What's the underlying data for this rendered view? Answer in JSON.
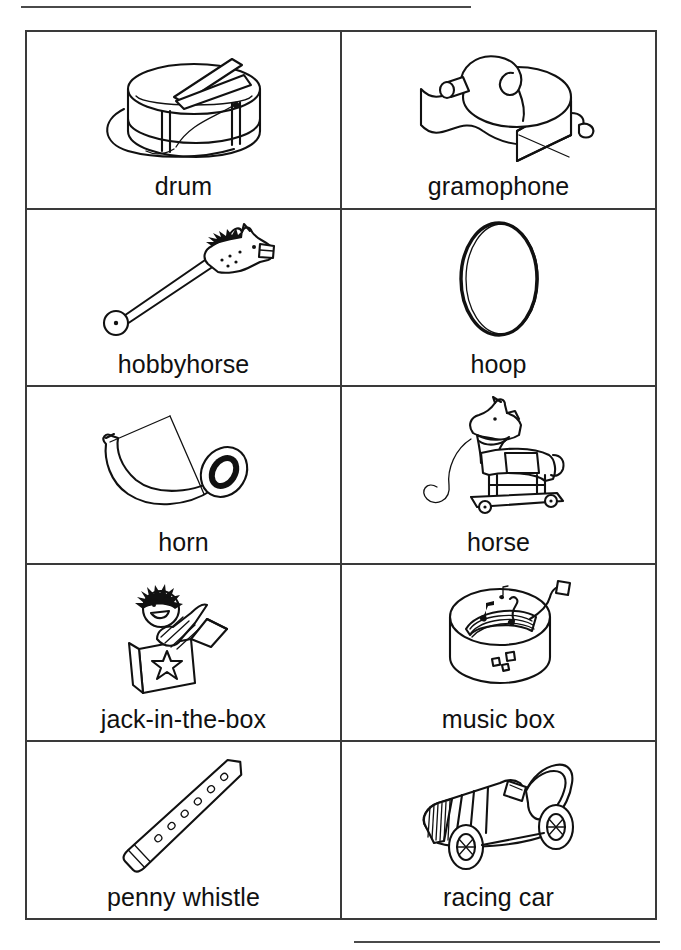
{
  "page": {
    "type": "picture-dictionary-worksheet",
    "topic": "toys and musical instruments",
    "background_color": "#ffffff",
    "ink_color": "#111111",
    "rule_color": "#4a4a4a"
  },
  "decorations": {
    "top_rule": "horizontal-rule",
    "bottom_rule": "horizontal-rule"
  },
  "grid": {
    "columns": 2,
    "rows": 5,
    "rows_data": [
      [
        {
          "label": "drum",
          "icon": "drum-icon"
        },
        {
          "label": "gramophone",
          "icon": "gramophone-icon"
        }
      ],
      [
        {
          "label": "hobbyhorse",
          "icon": "hobbyhorse-icon"
        },
        {
          "label": "hoop",
          "icon": "hoop-icon"
        }
      ],
      [
        {
          "label": "horn",
          "icon": "horn-icon"
        },
        {
          "label": "horse",
          "icon": "horse-icon"
        }
      ],
      [
        {
          "label": "jack-in-the-box",
          "icon": "jack-in-the-box-icon"
        },
        {
          "label": "music box",
          "icon": "music-box-icon"
        }
      ],
      [
        {
          "label": "penny whistle",
          "icon": "penny-whistle-icon"
        },
        {
          "label": "racing car",
          "icon": "racing-car-icon"
        }
      ]
    ]
  }
}
